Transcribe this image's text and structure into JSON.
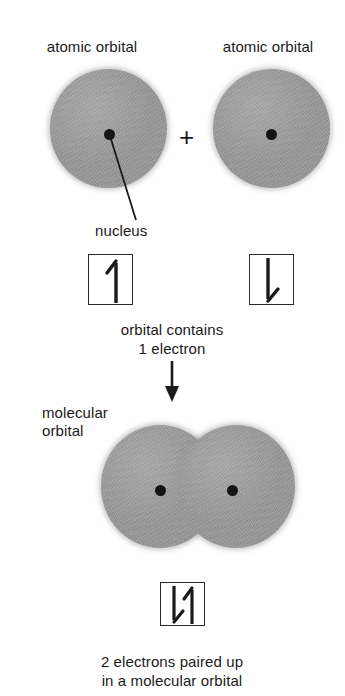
{
  "figure": {
    "type": "chemistry-diagram",
    "topic": "covalent bond formation from two atomic orbitals",
    "background_color": "#ffffff",
    "orbital_fill_color": "#9a9a9a",
    "ink_color": "#1a1a1a"
  },
  "labels": {
    "atomic_orbital_left": "atomic orbital",
    "atomic_orbital_right": "atomic orbital",
    "plus_sign": "+",
    "nucleus": "nucleus",
    "molecular_orbital": "molecular\norbital"
  },
  "captions": {
    "single_electron": "orbital contains\n1 electron",
    "paired_electrons": "2 electrons paired up\nin a molecular orbital"
  },
  "spin_boxes": [
    {
      "name": "left-atomic-orbital-box",
      "electrons": 1,
      "spins": [
        "up"
      ]
    },
    {
      "name": "right-atomic-orbital-box",
      "electrons": 1,
      "spins": [
        "down"
      ]
    },
    {
      "name": "molecular-orbital-box",
      "electrons": 2,
      "spins": [
        "down",
        "up"
      ]
    }
  ],
  "orbitals": [
    {
      "name": "atomic-orbital-left",
      "nuclei": 1
    },
    {
      "name": "atomic-orbital-right",
      "nuclei": 1
    },
    {
      "name": "molecular-orbital-merged",
      "nuclei": 2
    }
  ],
  "arrows": {
    "process_arrow_direction": "down"
  }
}
